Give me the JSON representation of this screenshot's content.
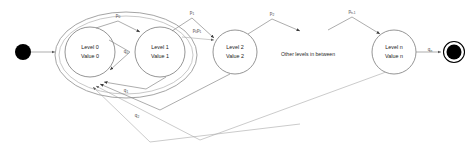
{
  "diagram": {
    "type": "state-machine",
    "canvas": {
      "width": 471,
      "height": 154
    },
    "colors": {
      "background": "#ffffff",
      "state_stroke": "#7a7a7a",
      "edge_stroke": "#8a8a8a",
      "composite_stroke": "#9a9a9a",
      "terminal": "#000000",
      "text": "#1a1a1a"
    },
    "start_node": {
      "label": "",
      "name": "initial-pseudostate"
    },
    "end_node": {
      "label": "",
      "name": "final-state"
    },
    "note": "Other levels in between",
    "states": [
      {
        "id": "level0",
        "line1": "Level 0",
        "line2": "Value 0",
        "cx": 90,
        "cy": 52,
        "r": 25
      },
      {
        "id": "level1",
        "line1": "Level 1",
        "line2": "Value 1",
        "cx": 160,
        "cy": 52,
        "r": 25
      },
      {
        "id": "level2",
        "line1": "Level 2",
        "line2": "Value 2",
        "cx": 235,
        "cy": 52,
        "r": 22
      },
      {
        "id": "leveln",
        "line1": "Level n",
        "line2": "Value n",
        "cx": 394,
        "cy": 52,
        "r": 22
      }
    ],
    "forward_labels": [
      {
        "id": "p0",
        "base": "p",
        "sub": "0",
        "x": 118,
        "y": 18
      },
      {
        "id": "p1",
        "base": "p",
        "sub": "1",
        "x": 192,
        "y": 15
      },
      {
        "id": "p0p1",
        "base": "p",
        "sub": "0",
        "base2": "p",
        "sub2": "1",
        "x": 197,
        "y": 32
      },
      {
        "id": "p2",
        "base": "p",
        "sub": "2",
        "x": 272,
        "y": 16
      },
      {
        "id": "pn1",
        "base": "p",
        "sub": "n-1",
        "x": 352,
        "y": 14
      }
    ],
    "return_labels": [
      {
        "id": "q0",
        "base": "q",
        "sub": "0",
        "x": 124,
        "y": 54
      },
      {
        "id": "q1",
        "base": "q",
        "sub": "1",
        "x": 124,
        "y": 93
      },
      {
        "id": "q2",
        "base": "q",
        "sub": "2",
        "x": 137,
        "y": 118
      },
      {
        "id": "qn",
        "base": "q",
        "sub": "n",
        "x": 430,
        "y": 53
      }
    ]
  }
}
